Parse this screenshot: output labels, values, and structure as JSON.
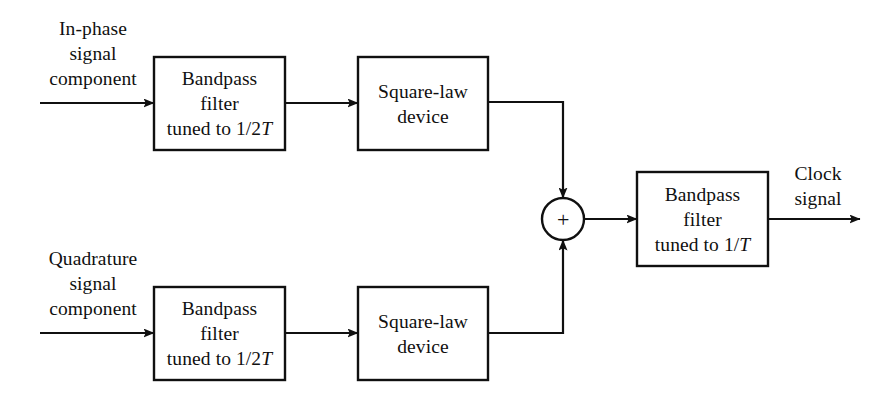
{
  "figure": {
    "type": "block-diagram",
    "background_color": "#ffffff",
    "line_color": "#101010",
    "text_color": "#101010"
  },
  "inputs": [
    {
      "id": "in-phase",
      "line1": "In-phase",
      "line2": "signal",
      "line3": "component"
    },
    {
      "id": "quadrature",
      "line1": "Quadrature",
      "line2": "signal",
      "line3": "component"
    }
  ],
  "blocks": [
    {
      "id": "bandpass-top",
      "line1": "Bandpass",
      "line2": "filter",
      "line3_pre": "tuned to 1/2",
      "line3_italic": "T"
    },
    {
      "id": "square-law-top",
      "line1": "Square-law",
      "line2": "device"
    },
    {
      "id": "bandpass-bottom",
      "line1": "Bandpass",
      "line2": "filter",
      "line3_pre": "tuned to 1/2",
      "line3_italic": "T"
    },
    {
      "id": "square-law-bottom",
      "line1": "Square-law",
      "line2": "device"
    },
    {
      "id": "bandpass-output",
      "line1": "Bandpass",
      "line2": "filter",
      "line3_pre": "tuned to 1/",
      "line3_italic": "T"
    }
  ],
  "summer": {
    "id": "summing-junction",
    "symbol": "+"
  },
  "output": {
    "id": "clock-signal",
    "line1": "Clock",
    "line2": "signal"
  }
}
